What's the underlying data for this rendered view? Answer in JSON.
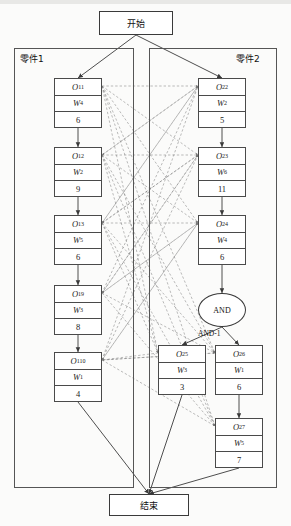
{
  "diagram": {
    "title_terminals": {
      "start": "开始",
      "end": "结束"
    },
    "containers": [
      {
        "id": "part1",
        "label": "零件1",
        "x": 14,
        "y": 48,
        "w": 120,
        "h": 440,
        "label_x": 20,
        "label_y": 52
      },
      {
        "id": "part2",
        "label": "零件2",
        "x": 149,
        "y": 48,
        "w": 128,
        "h": 440,
        "label_x": 236,
        "label_y": 52
      }
    ],
    "terminals": [
      {
        "id": "start",
        "label": "开始",
        "x": 99,
        "y": 11,
        "w": 74,
        "h": 24
      },
      {
        "id": "end",
        "label": "结束",
        "x": 109,
        "y": 494,
        "w": 80,
        "h": 22
      }
    ],
    "and_gate": {
      "label": "AND",
      "sublabel": "AND-1",
      "cx": 222,
      "cy": 310,
      "rx": 24,
      "ry": 17
    },
    "nodes": [
      {
        "id": "O11",
        "op": "O",
        "sub": "11",
        "w": "W",
        "wsub": "4",
        "time": "6",
        "x": 54,
        "y": 78,
        "bw": 48,
        "col": 1
      },
      {
        "id": "O12",
        "op": "O",
        "sub": "12",
        "w": "W",
        "wsub": "2",
        "time": "9",
        "x": 54,
        "y": 147,
        "bw": 48,
        "col": 1
      },
      {
        "id": "O13",
        "op": "O",
        "sub": "13",
        "w": "W",
        "wsub": "5",
        "time": "6",
        "x": 54,
        "y": 215,
        "bw": 48,
        "col": 1
      },
      {
        "id": "O19",
        "op": "O",
        "sub": "19",
        "w": "W",
        "wsub": "3",
        "time": "8",
        "x": 54,
        "y": 285,
        "bw": 48,
        "col": 1
      },
      {
        "id": "O110",
        "op": "O",
        "sub": "110",
        "w": "W",
        "wsub": "1",
        "time": "4",
        "x": 54,
        "y": 352,
        "bw": 48,
        "col": 1
      },
      {
        "id": "O22",
        "op": "O",
        "sub": "22",
        "w": "W",
        "wsub": "2",
        "time": "5",
        "x": 198,
        "y": 78,
        "bw": 48,
        "col": 2
      },
      {
        "id": "O23",
        "op": "O",
        "sub": "23",
        "w": "W",
        "wsub": "6",
        "time": "11",
        "x": 198,
        "y": 147,
        "bw": 48,
        "col": 2
      },
      {
        "id": "O24",
        "op": "O",
        "sub": "24",
        "w": "W",
        "wsub": "4",
        "time": "6",
        "x": 198,
        "y": 215,
        "bw": 48,
        "col": 2
      },
      {
        "id": "O25",
        "op": "O",
        "sub": "25",
        "w": "W",
        "wsub": "3",
        "time": "3",
        "x": 158,
        "y": 345,
        "bw": 48,
        "col": 2
      },
      {
        "id": "O26",
        "op": "O",
        "sub": "26",
        "w": "W",
        "wsub": "1",
        "time": "6",
        "x": 215,
        "y": 345,
        "bw": 48,
        "col": 2
      },
      {
        "id": "O27",
        "op": "O",
        "sub": "27",
        "w": "W",
        "wsub": "5",
        "time": "7",
        "x": 215,
        "y": 418,
        "bw": 48,
        "col": 2
      }
    ],
    "chain_edges": [
      {
        "from": "O11",
        "to": "O12"
      },
      {
        "from": "O12",
        "to": "O13"
      },
      {
        "from": "O13",
        "to": "O19"
      },
      {
        "from": "O19",
        "to": "O110"
      },
      {
        "from": "O22",
        "to": "O23"
      },
      {
        "from": "O23",
        "to": "O24"
      },
      {
        "from": "O24",
        "to": "AND"
      },
      {
        "from": "O26",
        "to": "O27"
      }
    ],
    "start_edges": [
      {
        "from": "start",
        "to": "O11"
      },
      {
        "from": "start",
        "to": "O22"
      }
    ],
    "end_edges": [
      {
        "from": "O110",
        "to": "end"
      },
      {
        "from": "O25",
        "to": "end"
      },
      {
        "from": "O27",
        "to": "end"
      }
    ],
    "cross_edges": [
      {
        "from": "O11",
        "to": "O22"
      },
      {
        "from": "O11",
        "to": "O23"
      },
      {
        "from": "O11",
        "to": "O24"
      },
      {
        "from": "O11",
        "to": "O25"
      },
      {
        "from": "O11",
        "to": "O26"
      },
      {
        "from": "O11",
        "to": "O27"
      },
      {
        "from": "O12",
        "to": "O22"
      },
      {
        "from": "O12",
        "to": "O23"
      },
      {
        "from": "O12",
        "to": "O24"
      },
      {
        "from": "O12",
        "to": "O25"
      },
      {
        "from": "O12",
        "to": "O26"
      },
      {
        "from": "O12",
        "to": "O27"
      },
      {
        "from": "O13",
        "to": "O22"
      },
      {
        "from": "O13",
        "to": "O23"
      },
      {
        "from": "O13",
        "to": "O24"
      },
      {
        "from": "O13",
        "to": "O25"
      },
      {
        "from": "O13",
        "to": "O26"
      },
      {
        "from": "O13",
        "to": "O27"
      },
      {
        "from": "O19",
        "to": "O22"
      },
      {
        "from": "O19",
        "to": "O23"
      },
      {
        "from": "O19",
        "to": "O24"
      },
      {
        "from": "O19",
        "to": "O26"
      },
      {
        "from": "O19",
        "to": "O27"
      },
      {
        "from": "O110",
        "to": "O22"
      },
      {
        "from": "O110",
        "to": "O23"
      },
      {
        "from": "O110",
        "to": "O24"
      },
      {
        "from": "O110",
        "to": "O26"
      },
      {
        "from": "O110",
        "to": "O27"
      },
      {
        "from": "O22",
        "to": "O12"
      },
      {
        "from": "O22",
        "to": "O13"
      },
      {
        "from": "O23",
        "to": "O13"
      },
      {
        "from": "O23",
        "to": "O19"
      },
      {
        "from": "O24",
        "to": "O19"
      },
      {
        "from": "O24",
        "to": "O110"
      },
      {
        "from": "O25",
        "to": "O110"
      },
      {
        "from": "O26",
        "to": "O110"
      }
    ],
    "colors": {
      "node_border": "#4a4a4a",
      "container_border": "#555555",
      "solid_edge": "#3a3a3a",
      "dashed_edge": "#777777",
      "background": "#fbfbfa",
      "text": "#1a1a1a"
    }
  }
}
